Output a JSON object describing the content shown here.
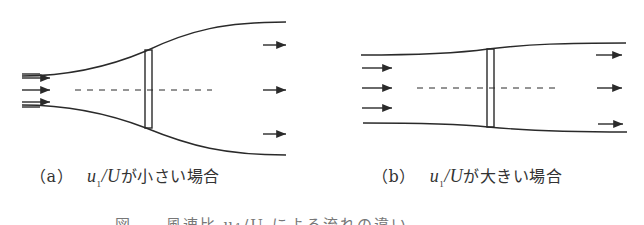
{
  "figure": {
    "panels": [
      {
        "id": "a",
        "label": "（a）",
        "variable": "u",
        "subscript": "1",
        "denominator": "/U",
        "text": "が小さい場合",
        "description": "Stream tube expands strongly downstream of actuator disk"
      },
      {
        "id": "b",
        "label": "（b）",
        "variable": "u",
        "subscript": "1",
        "denominator": "/U",
        "text": "が大きい場合",
        "description": "Stream tube expands slightly downstream of actuator disk"
      }
    ],
    "caption_partial": "図 . .   風速比   u₁/U   による流れの違い",
    "colors": {
      "line": "#2a2a2a",
      "background": "#ffffff"
    }
  }
}
